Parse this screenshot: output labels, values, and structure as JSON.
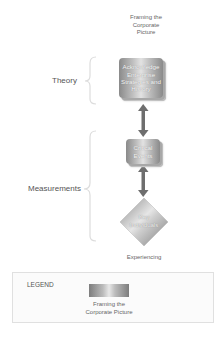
{
  "diagram": {
    "top_label": [
      "Framing the",
      "Corporate",
      "Picture"
    ],
    "bottom_label": "Experiencing",
    "groups": [
      {
        "label": "Theory"
      },
      {
        "label": "Measurements"
      }
    ],
    "nodes": [
      {
        "shape": "stacked-rectangle",
        "lines": [
          "Acknowledge",
          "Enterprise",
          "Strategies and",
          "History"
        ]
      },
      {
        "shape": "stacked-rectangle",
        "lines": [
          "Critical",
          "Events"
        ]
      },
      {
        "shape": "diamond",
        "lines": [
          "Key",
          "Individuals"
        ]
      }
    ],
    "connectors": [
      {
        "from": 0,
        "to": 1,
        "type": "double-arrow"
      },
      {
        "from": 1,
        "to": 2,
        "type": "double-arrow"
      }
    ]
  },
  "legend": {
    "title": "LEGEND",
    "items": [
      {
        "swatch": "gray-gradient",
        "label_lines": [
          "Framing the",
          "Corporate Picture"
        ]
      }
    ]
  },
  "colors": {
    "arrow": "#707070",
    "node_dark": "#8a8a8a",
    "node_light": "#e2e2e2",
    "bracket": "#e2e2e2"
  }
}
